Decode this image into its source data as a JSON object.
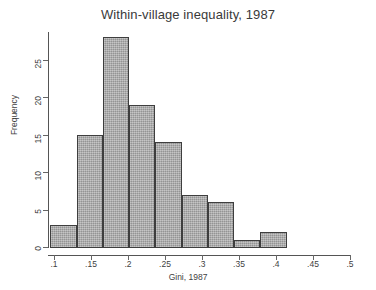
{
  "chart_data": {
    "type": "bar",
    "title": "Within-village inequality, 1987",
    "xlabel": "Gini, 1987",
    "ylabel": "Frequency",
    "xlim": [
      0.1,
      0.5
    ],
    "ylim": [
      0,
      28
    ],
    "grid": false,
    "legend": null,
    "bin_width": 0.0355,
    "bin_starts": [
      0.095,
      0.1305,
      0.166,
      0.2015,
      0.237,
      0.2725,
      0.308,
      0.3435,
      0.379
    ],
    "bin_ends": [
      0.1305,
      0.166,
      0.2015,
      0.237,
      0.2725,
      0.308,
      0.3435,
      0.379,
      0.4145
    ],
    "categories": [
      "0.095-0.131",
      "0.131-0.166",
      "0.166-0.202",
      "0.202-0.237",
      "0.237-0.273",
      "0.273-0.308",
      "0.308-0.344",
      "0.344-0.379",
      "0.379-0.415"
    ],
    "values": [
      3,
      15,
      28,
      19,
      14,
      7,
      6,
      1,
      2
    ],
    "xticks": [
      0.1,
      0.15,
      0.2,
      0.25,
      0.3,
      0.35,
      0.4,
      0.45,
      0.5
    ],
    "xtick_labels": [
      ".1",
      ".15",
      ".2",
      ".25",
      ".3",
      ".35",
      ".4",
      ".45",
      ".5"
    ],
    "yticks": [
      0,
      5,
      10,
      15,
      20,
      25
    ],
    "ytick_labels": [
      "0",
      "5",
      "10",
      "15",
      "20",
      "25"
    ],
    "bar_fill_color": "#a9a9a9",
    "bar_border_color": "#3e3e3e",
    "axis_color": "#555555",
    "text_color": "#3a3a3a"
  }
}
